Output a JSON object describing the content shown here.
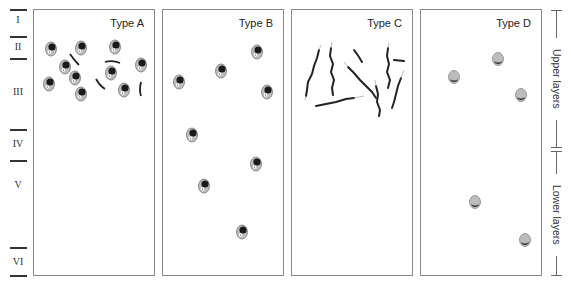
{
  "figure": {
    "layers": [
      {
        "label": "I",
        "top": 10,
        "bottom": 37
      },
      {
        "label": "II",
        "top": 37,
        "bottom": 58
      },
      {
        "label": "III",
        "top": 58,
        "bottom": 129
      },
      {
        "label": "IV",
        "top": 129,
        "bottom": 160
      },
      {
        "label": "V",
        "top": 160,
        "bottom": 246
      },
      {
        "label": "VI",
        "top": 246,
        "bottom": 276
      }
    ],
    "panels": [
      {
        "title": "Type A",
        "cell_style": "pyramidal-dark-nucleus",
        "distribution": "dense in layers II-III"
      },
      {
        "title": "Type B",
        "cell_style": "pyramidal-dark-nucleus",
        "distribution": "scattered through layers II-VI"
      },
      {
        "title": "Type C",
        "cell_style": "elongated-fibers",
        "distribution": "layers II-III"
      },
      {
        "title": "Type D",
        "cell_style": "round-light-cell",
        "distribution": "scattered upper and lower layers"
      }
    ],
    "side_brackets": [
      {
        "label": "Upper layers",
        "top": 10,
        "bottom": 148
      },
      {
        "label": "Lower layers",
        "top": 148,
        "bottom": 276
      }
    ],
    "colors": {
      "cell_body": "#b8b8b8",
      "nucleus": "#1a1a1a",
      "fiber": "#2a2a2a",
      "border": "#888888"
    }
  }
}
